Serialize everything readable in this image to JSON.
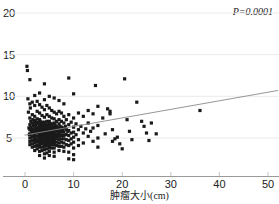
{
  "chart_data": {
    "type": "scatter",
    "title": "",
    "xlabel": "肿瘤大小(cm)",
    "ylabel": "",
    "annotation": "P=0.0001",
    "p_value": "0.0001",
    "xlim": [
      0,
      52
    ],
    "ylim": [
      0,
      21
    ],
    "xticks": [
      0,
      10,
      20,
      30,
      40,
      50
    ],
    "xtick_labels": [
      "0",
      "10",
      "20",
      "30",
      "40",
      "50"
    ],
    "yticks": [
      5,
      10,
      15,
      20
    ],
    "ytick_labels": [
      "5",
      "10",
      "15",
      "20"
    ],
    "grid": true,
    "grid_axis": "y",
    "point_color": "#1a1a1a",
    "point_size": 2.0,
    "line_color": "#8a8a8a",
    "axis_color": "#9a9a9a",
    "regression_line": {
      "x": [
        0,
        52
      ],
      "y": [
        5.35,
        10.7
      ]
    },
    "n_points": 281,
    "points": [
      [
        0.4,
        13.6
      ],
      [
        0.5,
        13.1
      ],
      [
        0.6,
        9.7
      ],
      [
        0.7,
        8.1
      ],
      [
        0.8,
        6.2
      ],
      [
        0.9,
        5.4
      ],
      [
        1.0,
        12.0
      ],
      [
        1.0,
        9.1
      ],
      [
        1.0,
        7.4
      ],
      [
        1.0,
        6.6
      ],
      [
        1.0,
        6.0
      ],
      [
        1.0,
        5.5
      ],
      [
        1.0,
        5.0
      ],
      [
        1.0,
        4.6
      ],
      [
        1.0,
        4.2
      ],
      [
        1.1,
        8.6
      ],
      [
        1.2,
        7.0
      ],
      [
        1.2,
        6.3
      ],
      [
        1.3,
        5.8
      ],
      [
        1.4,
        5.2
      ],
      [
        1.5,
        9.3
      ],
      [
        1.5,
        7.8
      ],
      [
        1.5,
        6.8
      ],
      [
        1.5,
        6.1
      ],
      [
        1.5,
        5.6
      ],
      [
        1.5,
        5.1
      ],
      [
        1.5,
        4.7
      ],
      [
        1.5,
        4.3
      ],
      [
        1.5,
        3.9
      ],
      [
        1.6,
        7.2
      ],
      [
        1.7,
        6.5
      ],
      [
        1.8,
        5.9
      ],
      [
        1.9,
        5.3
      ],
      [
        2.0,
        10.1
      ],
      [
        2.0,
        8.9
      ],
      [
        2.0,
        7.6
      ],
      [
        2.0,
        6.9
      ],
      [
        2.0,
        6.4
      ],
      [
        2.0,
        6.0
      ],
      [
        2.0,
        5.7
      ],
      [
        2.0,
        5.4
      ],
      [
        2.0,
        5.0
      ],
      [
        2.0,
        4.7
      ],
      [
        2.0,
        4.4
      ],
      [
        2.0,
        4.0
      ],
      [
        2.0,
        3.5
      ],
      [
        2.1,
        7.1
      ],
      [
        2.2,
        6.6
      ],
      [
        2.3,
        6.2
      ],
      [
        2.4,
        5.8
      ],
      [
        2.5,
        9.4
      ],
      [
        2.5,
        8.2
      ],
      [
        2.5,
        7.3
      ],
      [
        2.5,
        6.7
      ],
      [
        2.5,
        6.1
      ],
      [
        2.5,
        5.6
      ],
      [
        2.5,
        5.2
      ],
      [
        2.5,
        4.8
      ],
      [
        2.5,
        4.5
      ],
      [
        2.5,
        4.1
      ],
      [
        2.5,
        3.7
      ],
      [
        2.6,
        6.9
      ],
      [
        2.7,
        6.3
      ],
      [
        2.8,
        5.9
      ],
      [
        2.9,
        5.5
      ],
      [
        3.0,
        10.4
      ],
      [
        3.0,
        9.0
      ],
      [
        3.0,
        8.0
      ],
      [
        3.0,
        7.2
      ],
      [
        3.0,
        6.8
      ],
      [
        3.0,
        6.4
      ],
      [
        3.0,
        6.0
      ],
      [
        3.0,
        5.7
      ],
      [
        3.0,
        5.4
      ],
      [
        3.0,
        5.1
      ],
      [
        3.0,
        4.8
      ],
      [
        3.0,
        4.5
      ],
      [
        3.0,
        4.2
      ],
      [
        3.0,
        3.9
      ],
      [
        3.0,
        3.4
      ],
      [
        3.0,
        2.9
      ],
      [
        3.1,
        7.0
      ],
      [
        3.2,
        6.5
      ],
      [
        3.3,
        6.1
      ],
      [
        3.4,
        5.8
      ],
      [
        3.5,
        8.7
      ],
      [
        3.5,
        7.7
      ],
      [
        3.5,
        6.9
      ],
      [
        3.5,
        6.3
      ],
      [
        3.5,
        5.9
      ],
      [
        3.5,
        5.5
      ],
      [
        3.5,
        5.2
      ],
      [
        3.5,
        4.9
      ],
      [
        3.5,
        4.6
      ],
      [
        3.5,
        4.3
      ],
      [
        3.5,
        3.9
      ],
      [
        3.5,
        3.5
      ],
      [
        3.6,
        6.6
      ],
      [
        3.7,
        6.2
      ],
      [
        3.8,
        5.8
      ],
      [
        3.9,
        5.4
      ],
      [
        4.0,
        11.5
      ],
      [
        4.0,
        9.6
      ],
      [
        4.0,
        8.4
      ],
      [
        4.0,
        7.5
      ],
      [
        4.0,
        6.9
      ],
      [
        4.0,
        6.5
      ],
      [
        4.0,
        6.1
      ],
      [
        4.0,
        5.8
      ],
      [
        4.0,
        5.5
      ],
      [
        4.0,
        5.2
      ],
      [
        4.0,
        4.9
      ],
      [
        4.0,
        4.6
      ],
      [
        4.0,
        4.3
      ],
      [
        4.0,
        4.0
      ],
      [
        4.0,
        3.6
      ],
      [
        4.0,
        3.1
      ],
      [
        4.0,
        2.6
      ],
      [
        4.1,
        6.7
      ],
      [
        4.2,
        6.3
      ],
      [
        4.3,
        5.9
      ],
      [
        4.4,
        5.6
      ],
      [
        4.5,
        8.9
      ],
      [
        4.5,
        7.8
      ],
      [
        4.5,
        7.0
      ],
      [
        4.5,
        6.5
      ],
      [
        4.5,
        6.0
      ],
      [
        4.5,
        5.7
      ],
      [
        4.5,
        5.3
      ],
      [
        4.5,
        5.0
      ],
      [
        4.5,
        4.7
      ],
      [
        4.5,
        4.4
      ],
      [
        4.5,
        4.1
      ],
      [
        4.5,
        3.7
      ],
      [
        4.5,
        3.2
      ],
      [
        4.6,
        6.6
      ],
      [
        4.7,
        6.2
      ],
      [
        4.8,
        5.8
      ],
      [
        4.9,
        5.4
      ],
      [
        5.0,
        10.0
      ],
      [
        5.0,
        8.6
      ],
      [
        5.0,
        7.6
      ],
      [
        5.0,
        7.0
      ],
      [
        5.0,
        6.6
      ],
      [
        5.0,
        6.2
      ],
      [
        5.0,
        5.9
      ],
      [
        5.0,
        5.6
      ],
      [
        5.0,
        5.3
      ],
      [
        5.0,
        5.0
      ],
      [
        5.0,
        4.7
      ],
      [
        5.0,
        4.4
      ],
      [
        5.0,
        4.1
      ],
      [
        5.0,
        3.8
      ],
      [
        5.0,
        3.4
      ],
      [
        5.0,
        2.9
      ],
      [
        5.1,
        6.8
      ],
      [
        5.2,
        6.4
      ],
      [
        5.3,
        6.0
      ],
      [
        5.4,
        5.6
      ],
      [
        5.5,
        8.3
      ],
      [
        5.5,
        7.4
      ],
      [
        5.5,
        6.7
      ],
      [
        5.5,
        6.2
      ],
      [
        5.5,
        5.8
      ],
      [
        5.5,
        5.4
      ],
      [
        5.5,
        5.1
      ],
      [
        5.5,
        4.8
      ],
      [
        5.5,
        4.5
      ],
      [
        5.5,
        4.2
      ],
      [
        5.5,
        3.8
      ],
      [
        5.6,
        6.5
      ],
      [
        5.7,
        6.1
      ],
      [
        5.8,
        5.7
      ],
      [
        5.9,
        5.3
      ],
      [
        6.0,
        9.8
      ],
      [
        6.0,
        8.1
      ],
      [
        6.0,
        7.3
      ],
      [
        6.0,
        6.8
      ],
      [
        6.0,
        6.3
      ],
      [
        6.0,
        6.0
      ],
      [
        6.0,
        5.7
      ],
      [
        6.0,
        5.4
      ],
      [
        6.0,
        5.1
      ],
      [
        6.0,
        4.8
      ],
      [
        6.0,
        4.5
      ],
      [
        6.0,
        4.2
      ],
      [
        6.0,
        3.8
      ],
      [
        6.0,
        3.3
      ],
      [
        6.0,
        2.8
      ],
      [
        6.2,
        6.6
      ],
      [
        6.4,
        6.1
      ],
      [
        6.5,
        7.9
      ],
      [
        6.5,
        7.0
      ],
      [
        6.5,
        6.4
      ],
      [
        6.5,
        5.9
      ],
      [
        6.5,
        5.5
      ],
      [
        6.5,
        5.2
      ],
      [
        6.5,
        4.9
      ],
      [
        6.5,
        4.5
      ],
      [
        6.5,
        4.1
      ],
      [
        6.6,
        6.2
      ],
      [
        6.8,
        5.8
      ],
      [
        7.0,
        9.5
      ],
      [
        7.0,
        8.2
      ],
      [
        7.0,
        7.2
      ],
      [
        7.0,
        6.7
      ],
      [
        7.0,
        6.2
      ],
      [
        7.0,
        5.8
      ],
      [
        7.0,
        5.5
      ],
      [
        7.0,
        5.2
      ],
      [
        7.0,
        4.8
      ],
      [
        7.0,
        4.4
      ],
      [
        7.0,
        4.0
      ],
      [
        7.0,
        3.5
      ],
      [
        7.2,
        6.4
      ],
      [
        7.4,
        5.9
      ],
      [
        7.5,
        8.0
      ],
      [
        7.5,
        7.0
      ],
      [
        7.5,
        6.3
      ],
      [
        7.5,
        5.7
      ],
      [
        7.5,
        5.3
      ],
      [
        7.5,
        4.9
      ],
      [
        7.5,
        4.5
      ],
      [
        7.5,
        4.0
      ],
      [
        7.8,
        6.0
      ],
      [
        8.0,
        9.1
      ],
      [
        8.0,
        7.6
      ],
      [
        8.0,
        6.8
      ],
      [
        8.0,
        6.2
      ],
      [
        8.0,
        5.7
      ],
      [
        8.0,
        5.3
      ],
      [
        8.0,
        4.9
      ],
      [
        8.0,
        4.4
      ],
      [
        8.0,
        3.9
      ],
      [
        8.0,
        3.4
      ],
      [
        8.3,
        6.4
      ],
      [
        8.5,
        7.2
      ],
      [
        8.5,
        6.0
      ],
      [
        8.5,
        5.4
      ],
      [
        8.5,
        4.8
      ],
      [
        8.5,
        4.2
      ],
      [
        8.8,
        5.8
      ],
      [
        9.0,
        12.2
      ],
      [
        9.0,
        7.8
      ],
      [
        9.0,
        6.6
      ],
      [
        9.0,
        5.9
      ],
      [
        9.0,
        5.3
      ],
      [
        9.0,
        4.7
      ],
      [
        9.0,
        4.1
      ],
      [
        9.0,
        3.3
      ],
      [
        9.0,
        2.5
      ],
      [
        9.5,
        6.9
      ],
      [
        9.5,
        5.6
      ],
      [
        9.5,
        4.9
      ],
      [
        9.5,
        4.3
      ],
      [
        10.0,
        10.3
      ],
      [
        10.0,
        7.4
      ],
      [
        10.0,
        6.3
      ],
      [
        10.0,
        5.7
      ],
      [
        10.0,
        5.1
      ],
      [
        10.0,
        4.5
      ],
      [
        10.0,
        3.8
      ],
      [
        10.0,
        3.0
      ],
      [
        10.0,
        2.4
      ],
      [
        10.5,
        6.7
      ],
      [
        10.5,
        5.4
      ],
      [
        11.0,
        8.0
      ],
      [
        11.0,
        6.0
      ],
      [
        11.0,
        4.8
      ],
      [
        11.0,
        4.1
      ],
      [
        11.5,
        6.4
      ],
      [
        12.0,
        7.6
      ],
      [
        12.0,
        5.6
      ],
      [
        12.0,
        4.4
      ],
      [
        12.5,
        6.1
      ],
      [
        13.0,
        8.3
      ],
      [
        13.0,
        6.8
      ],
      [
        13.0,
        5.2
      ],
      [
        13.5,
        5.8
      ],
      [
        14.0,
        7.9
      ],
      [
        14.0,
        6.2
      ],
      [
        14.0,
        4.6
      ],
      [
        14.5,
        11.3
      ],
      [
        15.0,
        8.8
      ],
      [
        15.0,
        6.5
      ],
      [
        15.0,
        5.0
      ],
      [
        15.0,
        3.9
      ],
      [
        16.0,
        7.4
      ],
      [
        16.5,
        5.5
      ],
      [
        17.0,
        8.5
      ],
      [
        17.5,
        8.2
      ],
      [
        17.5,
        7.9
      ],
      [
        18.0,
        6.0
      ],
      [
        18.0,
        4.6
      ],
      [
        18.5,
        4.9
      ],
      [
        19.0,
        5.1
      ],
      [
        19.5,
        4.3
      ],
      [
        20.0,
        3.7
      ],
      [
        20.5,
        12.1
      ],
      [
        21.0,
        7.2
      ],
      [
        21.5,
        5.8
      ],
      [
        22.0,
        4.8
      ],
      [
        23.0,
        9.3
      ],
      [
        24.0,
        7.0
      ],
      [
        24.5,
        6.4
      ],
      [
        25.0,
        5.6
      ],
      [
        25.5,
        4.7
      ],
      [
        26.0,
        6.8
      ],
      [
        27.0,
        5.5
      ],
      [
        36.0,
        8.3
      ]
    ]
  }
}
